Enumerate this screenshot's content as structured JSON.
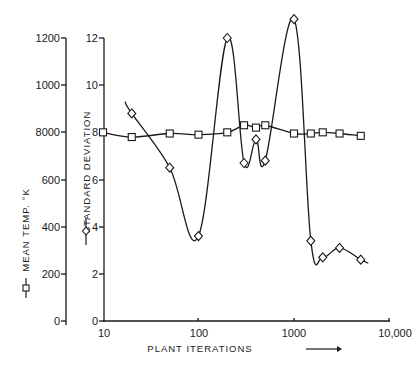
{
  "chart_data": {
    "type": "line",
    "title": "",
    "xlabel": "PLANT ITERATIONS",
    "xscale": "log",
    "xlim": [
      10,
      10000
    ],
    "x_ticks": [
      "10",
      "100",
      "1000",
      "10,000"
    ],
    "y_axes": [
      {
        "id": "left",
        "label": "MEAN TEMP. °K",
        "marker": "square",
        "ylim": [
          0,
          1200
        ],
        "ticks": [
          "0",
          "200",
          "400",
          "600",
          "8000",
          "1000",
          "1200"
        ]
      },
      {
        "id": "right",
        "label": "STANDARD DEVIATION",
        "marker": "diamond",
        "ylim": [
          0,
          12
        ],
        "ticks": [
          "0",
          "2",
          "4",
          "6",
          "8",
          "10",
          "12"
        ]
      }
    ],
    "series": [
      {
        "name": "MEAN TEMP. °K",
        "axis": "left",
        "marker": "square",
        "x": [
          10,
          20,
          50,
          100,
          200,
          300,
          400,
          500,
          1000,
          1500,
          2000,
          3000,
          5000
        ],
        "values": [
          800,
          780,
          795,
          790,
          800,
          830,
          820,
          830,
          795,
          795,
          800,
          795,
          785
        ]
      },
      {
        "name": "STANDARD DEVIATION",
        "axis": "right",
        "marker": "diamond",
        "x": [
          20,
          50,
          100,
          200,
          300,
          400,
          500,
          1000,
          1500,
          2000,
          3000,
          5000
        ],
        "values": [
          8.8,
          6.5,
          3.6,
          12.0,
          6.7,
          7.7,
          6.8,
          12.8,
          3.4,
          2.7,
          3.1,
          2.6
        ]
      }
    ],
    "grid": false,
    "legend_position": "rotated labels beside y-axes"
  },
  "labels": {
    "x_axis_title": "PLANT ITERATIONS",
    "left_axis_title": "MEAN TEMP. °K",
    "right_axis_title": "STANDARD DEVIATION",
    "x_ticks": [
      "10",
      "100",
      "1000",
      "10,000"
    ],
    "left_ticks": [
      "0",
      "200",
      "400",
      "600",
      "8000",
      "1000",
      "1200"
    ],
    "right_ticks": [
      "0",
      "2",
      "4",
      "6",
      "8",
      "10",
      "12"
    ]
  }
}
